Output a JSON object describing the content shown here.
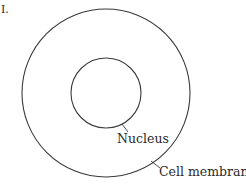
{
  "figure": {
    "label": "I.",
    "stroke_color": "#3a3a3a",
    "background": "#ffffff"
  },
  "shapes": {
    "cell": {
      "cx": 106,
      "cy": 93,
      "r": 84
    },
    "nucleus": {
      "cx": 106,
      "cy": 93,
      "r": 35
    }
  },
  "labels": {
    "nucleus": "Nucleus",
    "cell_membrane": "Cell membrane"
  }
}
